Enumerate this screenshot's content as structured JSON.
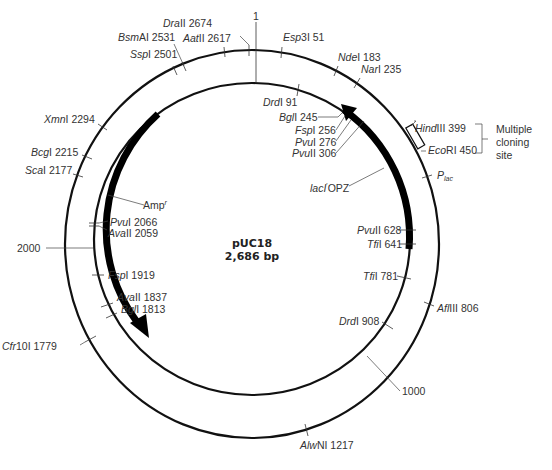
{
  "plasmid": {
    "name": "pUC18",
    "size_label": "2,686 bp",
    "origin_label": "1"
  },
  "scale_marks": [
    {
      "label": "1000"
    },
    {
      "label": "2000"
    }
  ],
  "outer_sites": [
    {
      "enzyme": "DraII",
      "italic": "Dra",
      "suffix": "II",
      "pos": "2674"
    },
    {
      "enzyme": "AatII",
      "italic": "Aat",
      "suffix": "II",
      "pos": "2617"
    },
    {
      "enzyme": "BsmAI",
      "italic": "Bsm",
      "suffix": "AI",
      "pos": "2531"
    },
    {
      "enzyme": "SspI",
      "italic": "Ssp",
      "suffix": "I",
      "pos": "2501"
    },
    {
      "enzyme": "Esp3I",
      "italic": "Esp",
      "suffix": "3I",
      "pos": "51"
    },
    {
      "enzyme": "NdeI",
      "italic": "Nde",
      "suffix": "I",
      "pos": "183"
    },
    {
      "enzyme": "NarI",
      "italic": "Nar",
      "suffix": "I",
      "pos": "235"
    },
    {
      "enzyme": "HindIII",
      "italic": "Hind",
      "suffix": "III",
      "pos": "399"
    },
    {
      "enzyme": "EcoRI",
      "italic": "Eco",
      "suffix": "RI",
      "pos": "450"
    },
    {
      "enzyme": "AflIII",
      "italic": "Afl",
      "suffix": "III",
      "pos": "806"
    },
    {
      "enzyme": "AlwNI",
      "italic": "Alw",
      "suffix": "NI",
      "pos": "1217"
    },
    {
      "enzyme": "Cfr10I",
      "italic": "Cfr",
      "suffix": "10I",
      "pos": "1779"
    },
    {
      "enzyme": "ScaI",
      "italic": "Sca",
      "suffix": "I",
      "pos": "2177"
    },
    {
      "enzyme": "BcgI",
      "italic": "Bcg",
      "suffix": "I",
      "pos": "2215"
    },
    {
      "enzyme": "XmnI",
      "italic": "Xmn",
      "suffix": "I",
      "pos": "2294"
    }
  ],
  "inner_sites": [
    {
      "enzyme": "DrdI",
      "italic": "Drd",
      "suffix": "I",
      "pos": "91"
    },
    {
      "enzyme": "BglI",
      "italic": "Bgl",
      "suffix": "I",
      "pos": "245"
    },
    {
      "enzyme": "FspI",
      "italic": "Fsp",
      "suffix": "I",
      "pos": "256"
    },
    {
      "enzyme": "PvuI",
      "italic": "Pvu",
      "suffix": "I",
      "pos": "276"
    },
    {
      "enzyme": "PvuII",
      "italic": "Pvu",
      "suffix": "II",
      "pos": "306"
    },
    {
      "enzyme": "PvuII",
      "italic": "Pvu",
      "suffix": "II",
      "pos": "628"
    },
    {
      "enzyme": "TfiI",
      "italic": "Tfi",
      "suffix": "I",
      "pos": "641"
    },
    {
      "enzyme": "TfiI",
      "italic": "Tfi",
      "suffix": "I",
      "pos": "781"
    },
    {
      "enzyme": "DrdI",
      "italic": "Drd",
      "suffix": "I",
      "pos": "908"
    },
    {
      "enzyme": "PvuI",
      "italic": "Pvu",
      "suffix": "I",
      "pos": "2066"
    },
    {
      "enzyme": "AvaII",
      "italic": "Ava",
      "suffix": "II",
      "pos": "2059"
    },
    {
      "enzyme": "FspI",
      "italic": "Fsp",
      "suffix": "I",
      "pos": "1919"
    },
    {
      "enzyme": "AvaII",
      "italic": "Ava",
      "suffix": "II",
      "pos": "1837"
    },
    {
      "enzyme": "BglI",
      "italic": "Bgl",
      "suffix": "I",
      "pos": "1813"
    }
  ],
  "features": {
    "amp": {
      "name": "Amp",
      "superscript": "r"
    },
    "lacz": {
      "prefix": "lacI",
      "suffix": "OPZ",
      "superscript": "'"
    },
    "plac": {
      "name": "P",
      "subscript": "lac"
    },
    "mcs": {
      "line1": "Multiple",
      "line2": "cloning",
      "line3": "site"
    }
  }
}
